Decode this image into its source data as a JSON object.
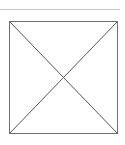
{
  "image_placeholder": {
    "icon": "broken-image-placeholder-icon",
    "border_color": "#707070",
    "divider_color": "#c8c8c8"
  }
}
